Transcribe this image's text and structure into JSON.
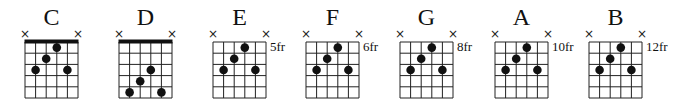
{
  "diagram": {
    "strings": 6,
    "frets_shown": 5,
    "colors": {
      "ink": "#111111",
      "background": "#ffffff"
    },
    "chords": [
      {
        "name": "C",
        "fret_label": "",
        "nut": true,
        "muted_strings": [
          1,
          6
        ],
        "dots": [
          {
            "string": 4,
            "fret": 1
          },
          {
            "string": 3,
            "fret": 2
          },
          {
            "string": 2,
            "fret": 3
          },
          {
            "string": 5,
            "fret": 3
          }
        ]
      },
      {
        "name": "D",
        "fret_label": "",
        "nut": true,
        "muted_strings": [
          1,
          6
        ],
        "dots": [
          {
            "string": 4,
            "fret": 3
          },
          {
            "string": 3,
            "fret": 4
          },
          {
            "string": 2,
            "fret": 5
          },
          {
            "string": 5,
            "fret": 5
          }
        ]
      },
      {
        "name": "E",
        "fret_label": "5fr",
        "nut": false,
        "muted_strings": [
          1,
          6
        ],
        "dots": [
          {
            "string": 4,
            "fret": 1
          },
          {
            "string": 3,
            "fret": 2
          },
          {
            "string": 2,
            "fret": 3
          },
          {
            "string": 5,
            "fret": 3
          }
        ]
      },
      {
        "name": "F",
        "fret_label": "6fr",
        "nut": false,
        "muted_strings": [
          1,
          6
        ],
        "dots": [
          {
            "string": 4,
            "fret": 1
          },
          {
            "string": 3,
            "fret": 2
          },
          {
            "string": 2,
            "fret": 3
          },
          {
            "string": 5,
            "fret": 3
          }
        ]
      },
      {
        "name": "G",
        "fret_label": "8fr",
        "nut": false,
        "muted_strings": [
          1,
          6
        ],
        "dots": [
          {
            "string": 4,
            "fret": 1
          },
          {
            "string": 3,
            "fret": 2
          },
          {
            "string": 2,
            "fret": 3
          },
          {
            "string": 5,
            "fret": 3
          }
        ]
      },
      {
        "name": "A",
        "fret_label": "10fr",
        "nut": false,
        "muted_strings": [
          1,
          6
        ],
        "dots": [
          {
            "string": 4,
            "fret": 1
          },
          {
            "string": 3,
            "fret": 2
          },
          {
            "string": 2,
            "fret": 3
          },
          {
            "string": 5,
            "fret": 3
          }
        ]
      },
      {
        "name": "B",
        "fret_label": "12fr",
        "nut": false,
        "muted_strings": [
          1,
          6
        ],
        "dots": [
          {
            "string": 4,
            "fret": 1
          },
          {
            "string": 3,
            "fret": 2
          },
          {
            "string": 2,
            "fret": 3
          },
          {
            "string": 5,
            "fret": 3
          }
        ]
      }
    ],
    "mute_symbol": "×"
  }
}
